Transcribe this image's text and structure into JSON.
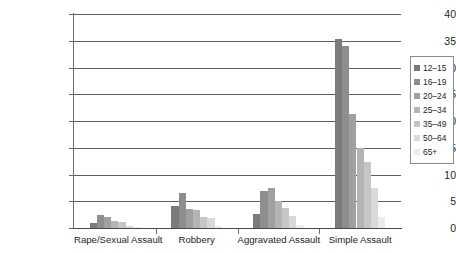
{
  "chart_data": {
    "type": "bar",
    "title": "",
    "subtitle": "",
    "xlabel": "",
    "ylabel": "",
    "ylim": [
      0,
      40
    ],
    "ytick_step": 5,
    "yticks": [
      0,
      5,
      10,
      15,
      20,
      25,
      30,
      35,
      40
    ],
    "ytick_labels": [
      "0",
      "5",
      "10",
      "15",
      "20",
      "25",
      "30",
      "35",
      "40"
    ],
    "grid": true,
    "grid_axis": "y",
    "legend_position": "right",
    "categories": [
      "Rape/Sexual Assault",
      "Robbery",
      "Aggravated Assault",
      "Simple Assault"
    ],
    "series": [
      {
        "name": "12–15",
        "color": "#7b7b7b",
        "values": [
          1.0,
          4.1,
          2.7,
          35.3
        ]
      },
      {
        "name": "16–19",
        "color": "#8e8e8e",
        "values": [
          2.4,
          6.5,
          7.0,
          34.0
        ]
      },
      {
        "name": "20–24",
        "color": "#a0a0a0",
        "values": [
          2.1,
          3.6,
          7.5,
          21.3
        ]
      },
      {
        "name": "25–34",
        "color": "#b4b4b4",
        "values": [
          1.4,
          3.3,
          5.0,
          15.0
        ]
      },
      {
        "name": "35–49",
        "color": "#c6c6c6",
        "values": [
          1.2,
          2.0,
          3.8,
          12.3
        ]
      },
      {
        "name": "50–64",
        "color": "#d9d9d9",
        "values": [
          0.3,
          1.9,
          2.3,
          7.5
        ]
      },
      {
        "name": "65+",
        "color": "#ececec",
        "values": [
          0.1,
          0.3,
          0.5,
          2.0
        ]
      }
    ]
  },
  "legend": {
    "entries": [
      "12–15",
      "16–19",
      "20–24",
      "25–34",
      "35–49",
      "50–64",
      "65+"
    ]
  },
  "colors": {
    "axis": "#6d6d6d",
    "gridline": "#5f5f5f",
    "text": "#231f20",
    "background": "#ffffff"
  }
}
